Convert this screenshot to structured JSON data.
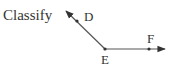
{
  "prompt": "Classify",
  "diagram": {
    "type": "angle",
    "name": "angle DEF",
    "vertex": {
      "label": "E",
      "x": 105,
      "y": 49
    },
    "points": [
      {
        "label": "D",
        "x": 77,
        "y": 21,
        "ray_tip": {
          "x": 65,
          "y": 10
        }
      },
      {
        "label": "F",
        "x": 149,
        "y": 49,
        "ray_tip": {
          "x": 166,
          "y": 49
        }
      }
    ],
    "colors": {
      "line": "#555555",
      "text": "#333333"
    }
  }
}
